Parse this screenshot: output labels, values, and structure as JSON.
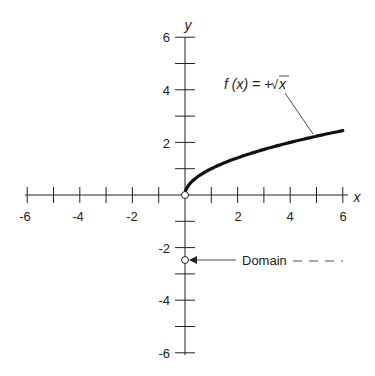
{
  "chart_data": {
    "type": "line",
    "title": "",
    "xlabel": "x",
    "ylabel": "y",
    "xlim": [
      -6,
      6
    ],
    "ylim": [
      -6,
      6
    ],
    "x_ticks": [
      "-6",
      "-4",
      "-2",
      "2",
      "4",
      "6"
    ],
    "y_ticks": [
      "6",
      "4",
      "2",
      "-2",
      "-4",
      "-6"
    ],
    "grid": false,
    "series": [
      {
        "name": "f(x) = +√x",
        "x": [
          0,
          0.5,
          1,
          2,
          3,
          4,
          5,
          6
        ],
        "values": [
          0,
          0.71,
          1,
          1.41,
          1.73,
          2,
          2.24,
          2.45
        ]
      }
    ],
    "annotations": [
      {
        "text": "f (x) = + √x",
        "points_to": "curve"
      },
      {
        "text": "Domain",
        "points_to": "open circle at (0,-2.5)"
      }
    ]
  },
  "labels": {
    "x_axis": "x",
    "y_axis": "y",
    "func_prefix": "f (x) = +",
    "func_sqrt": "√",
    "func_arg": "x",
    "domain": "Domain",
    "xt": [
      "-6",
      "-4",
      "-2",
      "2",
      "4",
      "6"
    ],
    "yt": [
      "6",
      "4",
      "2",
      "-2",
      "-4",
      "-6"
    ]
  }
}
